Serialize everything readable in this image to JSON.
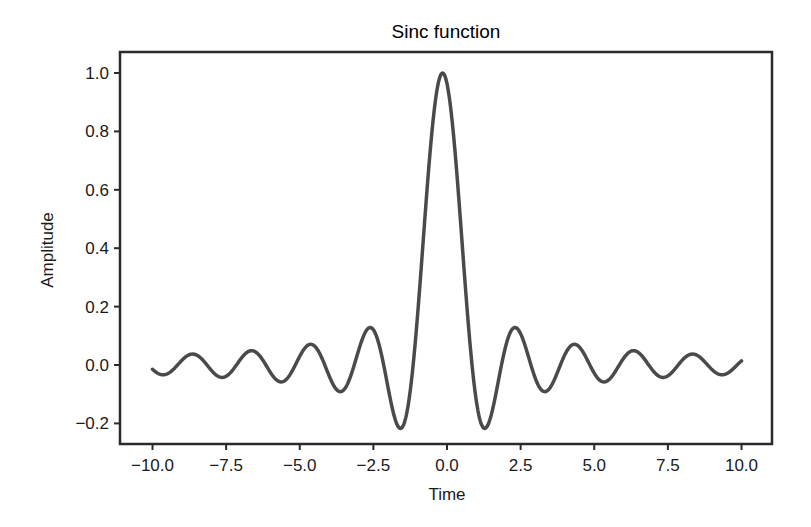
{
  "chart_data": {
    "type": "line",
    "title": "Sinc function",
    "xlabel": "Time",
    "ylabel": "Amplitude",
    "xlim": [
      -10.8,
      11.0
    ],
    "ylim": [
      -0.27,
      1.07
    ],
    "grid": false,
    "legend": null,
    "x_ticks": [
      -10.0,
      -7.5,
      -5.0,
      -2.5,
      0.0,
      2.5,
      5.0,
      7.5,
      10.0
    ],
    "x_tick_labels": [
      "−10.0",
      "−7.5",
      "−5.0",
      "−2.5",
      "0.0",
      "2.5",
      "5.0",
      "7.5",
      "10.0"
    ],
    "y_ticks": [
      1.0,
      0.8,
      0.6,
      0.4,
      0.2,
      0.0,
      -0.2
    ],
    "y_tick_labels": [
      "1.0",
      "0.8",
      "0.6",
      "0.4",
      "0.2",
      "0.0",
      "−0.2"
    ],
    "series": [
      {
        "name": "sinc",
        "color": "#4a4a4a",
        "function": "sin(pi*t)/(pi*t)",
        "x_range": [
          -10.0,
          10.0
        ],
        "key_points": [
          {
            "x": -10.0,
            "y": 0.0
          },
          {
            "x": -9.5,
            "y": -0.03
          },
          {
            "x": -8.5,
            "y": 0.04
          },
          {
            "x": -7.5,
            "y": -0.04
          },
          {
            "x": -6.5,
            "y": 0.05
          },
          {
            "x": -5.5,
            "y": -0.05
          },
          {
            "x": -4.5,
            "y": 0.08
          },
          {
            "x": -3.5,
            "y": -0.08
          },
          {
            "x": -2.5,
            "y": 0.14
          },
          {
            "x": -1.4,
            "y": -0.21
          },
          {
            "x": 0.0,
            "y": 1.0
          },
          {
            "x": 1.4,
            "y": -0.21
          },
          {
            "x": 2.5,
            "y": 0.14
          },
          {
            "x": 3.5,
            "y": -0.08
          },
          {
            "x": 4.5,
            "y": 0.08
          },
          {
            "x": 5.5,
            "y": -0.05
          },
          {
            "x": 6.5,
            "y": 0.05
          },
          {
            "x": 7.5,
            "y": -0.04
          },
          {
            "x": 8.5,
            "y": 0.04
          },
          {
            "x": 9.5,
            "y": -0.03
          },
          {
            "x": 10.0,
            "y": 0.0
          }
        ]
      }
    ]
  }
}
